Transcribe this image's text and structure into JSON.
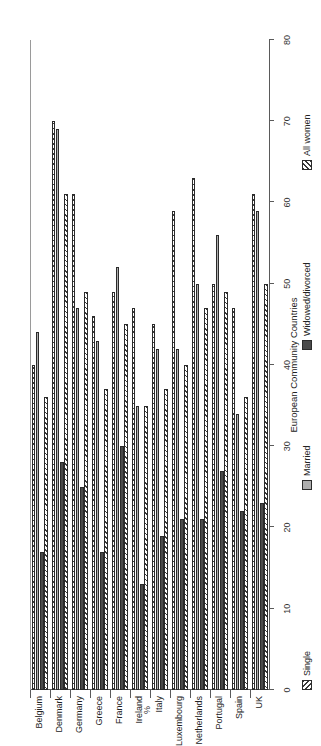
{
  "chart_data": {
    "type": "bar",
    "orientation": "horizontal",
    "title": "",
    "xlabel": "%",
    "ylabel": "European Community Countries",
    "ylim": [
      0,
      80
    ],
    "xlim": [
      0,
      80
    ],
    "grid": false,
    "legend_position": "bottom",
    "tick_labels": [
      "80",
      "70",
      "60",
      "50",
      "40",
      "30",
      "20",
      "10",
      "0"
    ],
    "ticks": [
      80,
      70,
      60,
      50,
      40,
      30,
      20,
      10,
      0
    ],
    "categories": [
      "Belgium",
      "Denmark",
      "Germany",
      "Greece",
      "France",
      "Ireland",
      "Italy",
      "Luxembourg",
      "Netherlands",
      "Portugal",
      "Spain",
      "UK"
    ],
    "series": [
      {
        "name": "Single",
        "key": "single",
        "values": [
          40,
          70,
          61,
          46,
          49,
          47,
          45,
          59,
          63,
          50,
          47,
          61
        ]
      },
      {
        "name": "Married",
        "key": "married",
        "values": [
          44,
          69,
          47,
          43,
          52,
          35,
          42,
          42,
          50,
          56,
          34,
          59
        ]
      },
      {
        "name": "Widowed/divorced",
        "key": "widowed",
        "values": [
          17,
          28,
          25,
          17,
          30,
          13,
          19,
          21,
          21,
          27,
          22,
          23
        ]
      },
      {
        "name": "All women",
        "key": "allwomen",
        "values": [
          36,
          61,
          49,
          37,
          45,
          35,
          37,
          40,
          47,
          49,
          36,
          50
        ]
      }
    ]
  },
  "axis": {
    "value_title": "%",
    "category_title": "European Community Countries"
  },
  "legend": {
    "items": [
      {
        "label": "Single",
        "key": "single"
      },
      {
        "label": "Married",
        "key": "married"
      },
      {
        "label": "Widowed/divorced",
        "key": "widowed"
      },
      {
        "label": "All women",
        "key": "allwomen"
      }
    ]
  }
}
